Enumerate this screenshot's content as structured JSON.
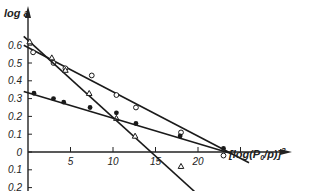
{
  "chart_data": {
    "type": "scatter",
    "title": "",
    "xlabel": "[log(P0/p)]^2",
    "ylabel": "log a",
    "xlim": [
      0,
      26
    ],
    "ylim": [
      -0.22,
      0.68
    ],
    "x_ticks": [
      5,
      10,
      15,
      20
    ],
    "x_tick_labels": [
      "5",
      "10",
      "15",
      "20"
    ],
    "y_ticks": [
      0.6,
      0.5,
      0.4,
      0.3,
      0.2,
      0.1,
      0,
      -0.1,
      -0.2
    ],
    "y_tick_labels": [
      "0.6",
      "0.5",
      "0.4",
      "0.3",
      "0.2",
      "0.1",
      "0",
      "0.1",
      "0.2"
    ],
    "grid": false,
    "legend": null,
    "series": [
      {
        "name": "open-circles",
        "marker": "circle-open",
        "points": [
          [
            0.6,
            0.56
          ],
          [
            3.0,
            0.5
          ],
          [
            4.4,
            0.47
          ],
          [
            7.5,
            0.43
          ],
          [
            10.4,
            0.32
          ],
          [
            12.7,
            0.25
          ],
          [
            18.0,
            0.11
          ],
          [
            23.0,
            -0.02
          ]
        ],
        "fit_line": [
          [
            -0.5,
            0.6
          ],
          [
            26,
            -0.06
          ]
        ]
      },
      {
        "name": "open-triangles",
        "marker": "triangle-open",
        "points": [
          [
            0.2,
            0.62
          ],
          [
            2.8,
            0.53
          ],
          [
            4.4,
            0.46
          ],
          [
            7.2,
            0.33
          ],
          [
            10.4,
            0.19
          ],
          [
            12.6,
            0.09
          ],
          [
            18.0,
            -0.08
          ]
        ],
        "fit_line": [
          [
            -0.5,
            0.65
          ],
          [
            20,
            -0.24
          ]
        ]
      },
      {
        "name": "filled-circles",
        "marker": "circle-filled",
        "points": [
          [
            0.7,
            0.33
          ],
          [
            3.0,
            0.3
          ],
          [
            4.2,
            0.28
          ],
          [
            7.3,
            0.25
          ],
          [
            10.4,
            0.22
          ],
          [
            12.7,
            0.16
          ],
          [
            17.9,
            0.09
          ],
          [
            23.0,
            0.02
          ]
        ],
        "fit_line": [
          [
            -0.5,
            0.34
          ],
          [
            24,
            -0.01
          ]
        ]
      }
    ]
  },
  "axes": {
    "y_title": "log a",
    "x_title_main": "[log(P",
    "x_title_sub": "0",
    "x_title_end": "/p)]",
    "x_title_sup": "2"
  }
}
